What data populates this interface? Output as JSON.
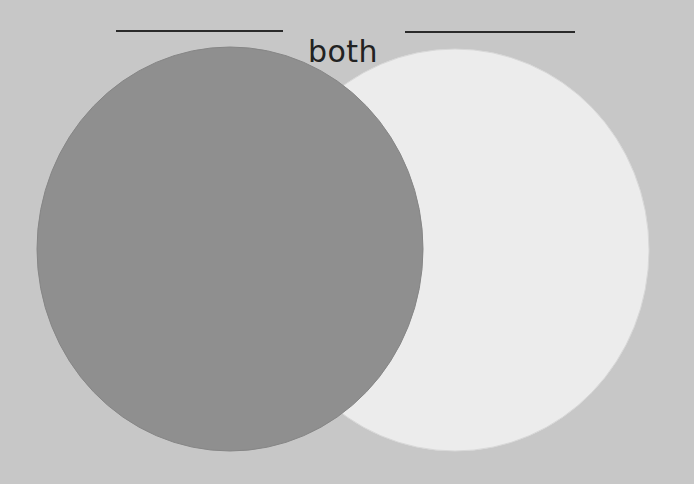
{
  "diagram": {
    "type": "venn",
    "overlap_label": "both",
    "left_set": {
      "label": "",
      "fill": "#8f8f8f"
    },
    "right_set": {
      "label": "",
      "fill": "#ececec"
    },
    "background": "#c7c7c7",
    "label_lines": [
      "blank-left-set-title",
      "blank-right-set-title"
    ]
  }
}
